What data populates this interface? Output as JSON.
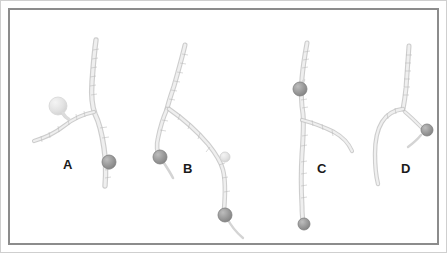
{
  "figure": {
    "width": 447,
    "height": 253,
    "background_color": "#ffffff",
    "outer_border_color": "#cfcfcf",
    "inner_border_color": "#8c8c8c",
    "vessel_color": "#c9c9c9",
    "vessel_core_color": "#ededed",
    "marker_dark_color": "#9a9a9a",
    "marker_dark_stroke": "#7c7c7c",
    "marker_light_color": "#e2e2e2",
    "marker_light_stroke": "#cdcdcd",
    "label_color": "#1a1a1a"
  },
  "panels": [
    {
      "label": "A",
      "label_x": 53,
      "label_y": 148,
      "description": "branching vessel with light bulbous aneurysm on left branch and gray spherical marker on lower main trunk",
      "markers": [
        {
          "name": "aneurysm-bulb",
          "tone": "light",
          "cx": 48,
          "cy": 96,
          "r": 9
        },
        {
          "name": "sphere-marker",
          "tone": "dark",
          "cx": 99,
          "cy": 152,
          "r": 7
        }
      ]
    },
    {
      "label": "B",
      "label_x": 183,
      "label_y": 152,
      "description": "Y-shaped bifurcation with gray marker on left limb, small light marker mid-right and gray marker on lower right limb",
      "markers": [
        {
          "name": "sphere-marker",
          "tone": "dark",
          "cx": 150,
          "cy": 147,
          "r": 7
        },
        {
          "name": "aneurysm-bulb",
          "tone": "light",
          "cx": 215,
          "cy": 147,
          "r": 5
        },
        {
          "name": "sphere-marker",
          "tone": "dark",
          "cx": 215,
          "cy": 205,
          "r": 7
        }
      ]
    },
    {
      "label": "C",
      "label_x": 317,
      "label_y": 152,
      "description": "near-vertical trunk with right-going side branch, gray marker upper left and gray marker at lower end",
      "markers": [
        {
          "name": "sphere-marker",
          "tone": "dark",
          "cx": 290,
          "cy": 79,
          "r": 7
        },
        {
          "name": "sphere-marker",
          "tone": "dark",
          "cx": 294,
          "cy": 214,
          "r": 6
        }
      ]
    },
    {
      "label": "D",
      "label_x": 397,
      "label_y": 152,
      "description": "vessel descending and curving left with short right-going branch carrying a gray spherical marker",
      "markers": [
        {
          "name": "sphere-marker",
          "tone": "dark",
          "cx": 417,
          "cy": 120,
          "r": 6
        }
      ]
    }
  ]
}
